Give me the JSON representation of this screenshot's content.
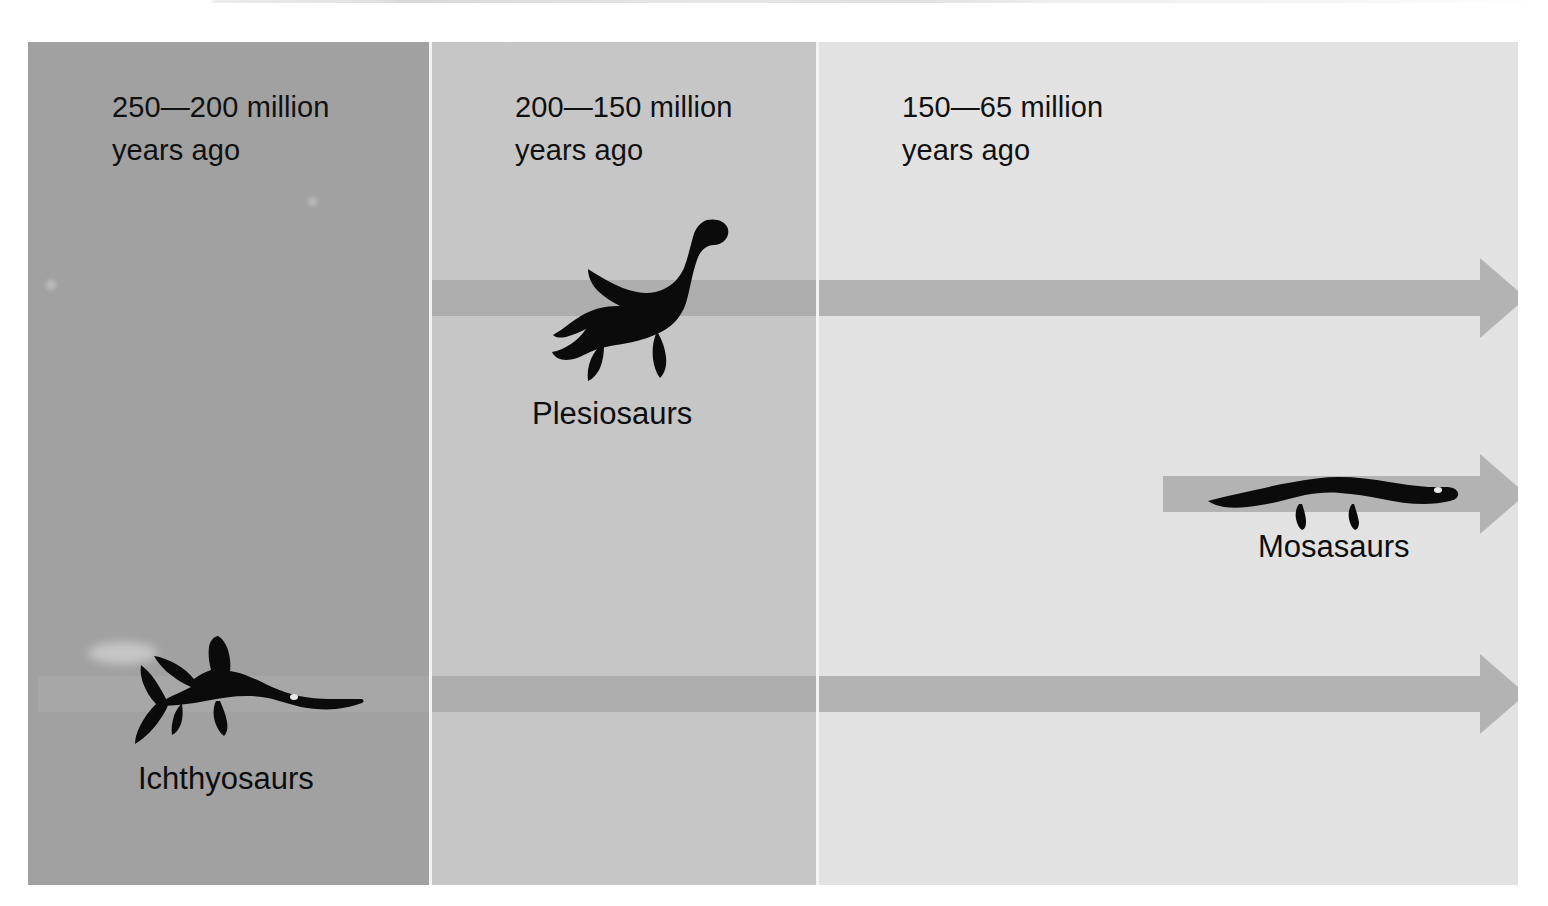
{
  "figure": {
    "background_color": "#ffffff",
    "plate": {
      "x": 28,
      "y": 42,
      "width": 1490,
      "height": 843
    }
  },
  "eras": [
    {
      "id": "triassic",
      "label": "250—200 million\nyears ago",
      "range_start_mya": 250,
      "range_end_mya": 200,
      "fill_color": "#a0a0a0",
      "x": 0,
      "width": 403
    },
    {
      "id": "jurassic",
      "label": "200—150 million\nyears ago",
      "range_start_mya": 200,
      "range_end_mya": 150,
      "fill_color": "#c8c8c8",
      "x": 403,
      "width": 387
    },
    {
      "id": "cretaceous",
      "label": "150—65 million\nyears ago",
      "range_start_mya": 150,
      "range_end_mya": 65,
      "fill_color": "#e6e6e6",
      "x": 790,
      "width": 700
    }
  ],
  "arrow_color": "#a8a8a8",
  "groups": [
    {
      "id": "plesiosaurs",
      "label": "Plesiosaurs",
      "icon": "plesiosaur-silhouette",
      "arrow": {
        "x": 403,
        "y": 256,
        "bar_length": 1049,
        "label_side": "below"
      },
      "creature": {
        "x": 512,
        "y": 205,
        "width": 205,
        "height": 165
      },
      "label_pos": {
        "x": 524,
        "y": 382
      },
      "first_appearance_mya": 200,
      "last_appearance_mya": 65
    },
    {
      "id": "mosasaurs",
      "label": "Mosasaurs",
      "icon": "mosasaur-silhouette",
      "arrow": {
        "x": 1135,
        "y": 452,
        "bar_length": 317,
        "label_side": "below"
      },
      "creature": {
        "x": 1205,
        "y": 468,
        "width": 245,
        "height": 62
      },
      "label_pos": {
        "x": 1258,
        "y": 518
      },
      "first_appearance_mya": 98,
      "last_appearance_mya": 65
    },
    {
      "id": "ichthyosaurs",
      "label": "Ichthyosaurs",
      "icon": "ichthyosaur-silhouette",
      "arrow": {
        "x": 10,
        "y": 652,
        "bar_length": 1442,
        "label_side": "below"
      },
      "creature": {
        "x": 88,
        "y": 635,
        "width": 240,
        "height": 110
      },
      "label_pos": {
        "x": 110,
        "y": 758
      },
      "first_appearance_mya": 250,
      "last_appearance_mya": 90
    }
  ]
}
